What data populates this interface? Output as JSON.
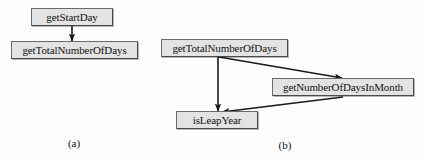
{
  "figure": {
    "background_color": "#fdfdfd",
    "node_fill_color": "#e3e3e3",
    "node_border_color": "#4a4a4a",
    "text_color": "#111111",
    "edge_color": "#1a1a1a"
  },
  "panels": [
    {
      "id": "panel-a",
      "caption": "(a)",
      "nodes": [
        {
          "id": "a-getStartDay",
          "label": "getStartDay"
        },
        {
          "id": "a-getTotalNumberOfDays",
          "label": "getTotalNumberOfDays"
        }
      ],
      "edges": [
        {
          "from": "getStartDay",
          "to": "getTotalNumberOfDays"
        }
      ]
    },
    {
      "id": "panel-b",
      "caption": "(b)",
      "nodes": [
        {
          "id": "b-getTotalNumberOfDays",
          "label": "getTotalNumberOfDays"
        },
        {
          "id": "b-getNumberOfDaysInMonth",
          "label": "getNumberOfDaysInMonth"
        },
        {
          "id": "b-isLeapYear",
          "label": "isLeapYear"
        }
      ],
      "edges": [
        {
          "from": "getTotalNumberOfDays",
          "to": "isLeapYear"
        },
        {
          "from": "getTotalNumberOfDays",
          "to": "getNumberOfDaysInMonth"
        },
        {
          "from": "getNumberOfDaysInMonth",
          "to": "isLeapYear"
        }
      ]
    }
  ]
}
